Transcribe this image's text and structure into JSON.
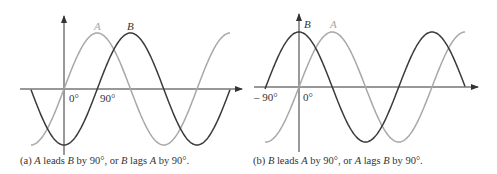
{
  "colors": {
    "waveA": "#a8a8a8",
    "waveB": "#3a3a3a",
    "axis": "#333333"
  },
  "panels": [
    {
      "id": "a",
      "labels": {
        "A": "A",
        "B": "B",
        "zero": "0°",
        "ninety": "90°"
      },
      "caption": {
        "prefix": "(a) ",
        "p1": "A",
        "t1": " leads ",
        "p2": "B",
        "t2": " by 90°, or ",
        "p3": "B",
        "t3": " lags ",
        "p4": "A",
        "t4": " by 90°."
      }
    },
    {
      "id": "b",
      "labels": {
        "A": "A",
        "B": "B",
        "zero": "0°",
        "minus_ninety": "– 90°"
      },
      "caption": {
        "prefix": "(b) ",
        "p1": "B",
        "t1": " leads ",
        "p2": "A",
        "t2": " by 90°, or ",
        "p3": "A",
        "t3": " lags ",
        "p4": "B",
        "t4": " by 90°."
      }
    }
  ]
}
